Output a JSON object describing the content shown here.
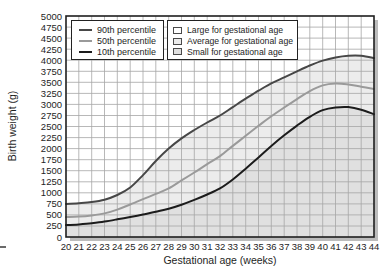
{
  "chart_data": {
    "type": "line",
    "title": "",
    "xlabel": "Gestational age (weeks)",
    "ylabel": "Birth weight (g)",
    "xlim": [
      20,
      44
    ],
    "ylim": [
      0,
      5000
    ],
    "x_tick_step": 1,
    "y_tick_step": 250,
    "grid": true,
    "grid_color": "#a6a6a6",
    "border_color": "#1f1f1f",
    "shadow_color": "#bcbcbc",
    "x": [
      20,
      21,
      22,
      23,
      24,
      25,
      26,
      27,
      28,
      29,
      30,
      31,
      32,
      33,
      34,
      35,
      36,
      37,
      38,
      39,
      40,
      41,
      42,
      43,
      44
    ],
    "series": [
      {
        "name": "90th percentile",
        "color": "#474747",
        "values": [
          750,
          765,
          790,
          845,
          950,
          1120,
          1400,
          1720,
          2000,
          2230,
          2420,
          2590,
          2750,
          2940,
          3130,
          3310,
          3475,
          3610,
          3750,
          3880,
          3990,
          4060,
          4100,
          4100,
          4050
        ]
      },
      {
        "name": "50th percentile",
        "color": "#9a9a9a",
        "values": [
          450,
          462,
          488,
          535,
          620,
          735,
          855,
          975,
          1100,
          1280,
          1460,
          1650,
          1830,
          2060,
          2290,
          2515,
          2730,
          2930,
          3120,
          3300,
          3430,
          3470,
          3450,
          3400,
          3350
        ]
      },
      {
        "name": "10th percentile",
        "color": "#1c1c1c",
        "values": [
          270,
          285,
          310,
          348,
          400,
          452,
          508,
          570,
          640,
          730,
          840,
          962,
          1100,
          1300,
          1545,
          1800,
          2060,
          2300,
          2520,
          2720,
          2870,
          2930,
          2940,
          2880,
          2780
        ]
      }
    ],
    "line_legend": [
      {
        "label": "90th percentile"
      },
      {
        "label": "50th percentile"
      },
      {
        "label": "10th percentile"
      }
    ],
    "area_legend": [
      {
        "label": "Large for gestational age",
        "fill": "#ffffff"
      },
      {
        "label": "Average for gestational age",
        "fill": "#ececec"
      },
      {
        "label": "Small for gestational age",
        "fill": "#e0e0e0"
      }
    ],
    "bands": {
      "large": "#ffffff",
      "average": "#ececec",
      "small": "#e0e0e0"
    }
  }
}
